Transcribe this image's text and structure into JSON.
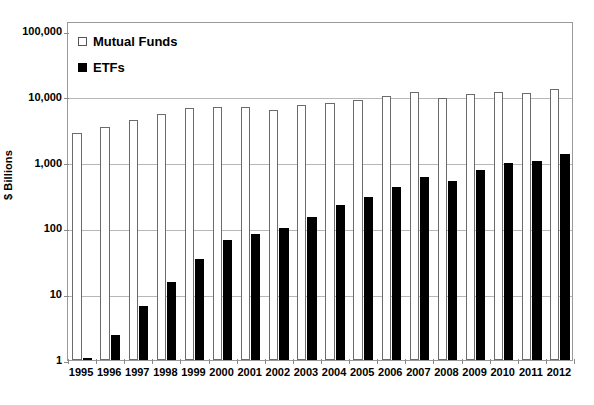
{
  "chart_data": {
    "type": "bar",
    "title": "",
    "subtitle": "",
    "xlabel": "",
    "ylabel": "$ Billions",
    "yscale": "log",
    "ylim": [
      1,
      100000
    ],
    "grid": true,
    "legend_position": "top-left",
    "y_ticks": [
      {
        "value": 1,
        "label": "1"
      },
      {
        "value": 10,
        "label": "10"
      },
      {
        "value": 100,
        "label": "100"
      },
      {
        "value": 1000,
        "label": "1,000"
      },
      {
        "value": 10000,
        "label": "10,000"
      },
      {
        "value": 100000,
        "label": "100,000"
      }
    ],
    "categories": [
      "1995",
      "1996",
      "1997",
      "1998",
      "1999",
      "2000",
      "2001",
      "2002",
      "2003",
      "2004",
      "2005",
      "2006",
      "2007",
      "2008",
      "2009",
      "2010",
      "2011",
      "2012"
    ],
    "series": [
      {
        "name": "Mutual Funds",
        "style": "open",
        "color": "#ffffff",
        "edge_color": "#6b6b6b",
        "values": [
          2812,
          3526,
          4468,
          5525,
          6846,
          6965,
          6975,
          6390,
          7414,
          8107,
          8905,
          10398,
          12001,
          9604,
          11113,
          11831,
          11627,
          13045
        ]
      },
      {
        "name": "ETFs",
        "style": "filled",
        "color": "#000000",
        "edge_color": "#000000",
        "values": [
          1,
          2.4,
          6.7,
          15.6,
          33.9,
          65.6,
          83,
          102,
          151,
          228,
          301,
          423,
          608,
          531,
          777,
          992,
          1048,
          1337
        ]
      }
    ]
  },
  "legend": {
    "items": [
      {
        "label": "Mutual Funds",
        "style": "open"
      },
      {
        "label": "ETFs",
        "style": "filled"
      }
    ]
  },
  "colors": {
    "grid": "#b7b7b7",
    "frame": "#9a9a9a",
    "mutual_funds": "#ffffff",
    "etfs": "#000000",
    "background": "#ffffff"
  }
}
